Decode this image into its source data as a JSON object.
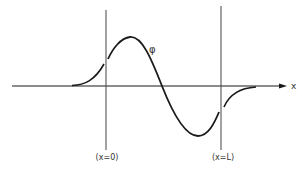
{
  "diagram": {
    "axis_label": "x",
    "function_label": "φ",
    "boundaries": [
      {
        "label": "(x=0)"
      },
      {
        "label": "(x=L)"
      }
    ],
    "colors": {
      "line": "#1a1a1a",
      "guide": "#444444",
      "background": "#ffffff"
    }
  }
}
